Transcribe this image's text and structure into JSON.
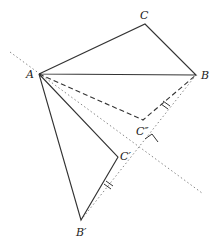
{
  "diagram": {
    "colors": {
      "stroke": "#333333",
      "dotted": "#888888",
      "background": "#ffffff"
    },
    "points": {
      "A": {
        "label": "A",
        "x": 39,
        "y": 74
      },
      "B": {
        "label": "B",
        "x": 196,
        "y": 75
      },
      "C": {
        "label": "C",
        "x": 145,
        "y": 24
      },
      "C_double_prime": {
        "label": "C″",
        "x": 143,
        "y": 120
      },
      "C_prime": {
        "label": "C′",
        "x": 118,
        "y": 157
      },
      "B_prime": {
        "label": "B′",
        "x": 81,
        "y": 220
      }
    },
    "labels": {
      "A": "A",
      "B": "B",
      "C": "C",
      "C_double_prime": "C″",
      "C_prime": "C′",
      "B_prime": "B′"
    },
    "segments": {
      "solid": [
        "AB",
        "BC",
        "CA",
        "AB′",
        "B′C′",
        "C′A"
      ],
      "dashed": [
        "AC″",
        "C″B"
      ],
      "dotted": [
        "reflection-axis",
        "line-BB′-extension"
      ]
    },
    "marks": {
      "right_angle": "at intersection of axis and line BB′",
      "equal_ticks": [
        "C″B",
        "C′B′"
      ]
    }
  }
}
